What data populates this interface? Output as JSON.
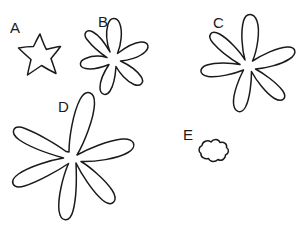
{
  "figure": {
    "width": 303,
    "height": 238,
    "background_color": "#ffffff",
    "stroke_color": "#1a1a1a",
    "label_color": "#1a1a1a"
  },
  "shapes": [
    {
      "id": "A",
      "label": "A",
      "label_x": 10,
      "label_y": 33,
      "petal_count": 5,
      "size": "small",
      "center_x": 40,
      "center_y": 55,
      "bbox": [
        18,
        33,
        62,
        76
      ]
    },
    {
      "id": "B",
      "label": "B",
      "label_x": 98,
      "label_y": 27,
      "petal_count": 6,
      "size": "medium",
      "center_x": 113,
      "center_y": 55,
      "bbox": [
        78,
        18,
        149,
        93
      ]
    },
    {
      "id": "C",
      "label": "C",
      "label_x": 213,
      "label_y": 28,
      "petal_count": 5,
      "size": "large",
      "center_x": 247,
      "center_y": 62,
      "bbox": [
        197,
        12,
        296,
        111
      ]
    },
    {
      "id": "D",
      "label": "D",
      "label_x": 58,
      "label_y": 112,
      "petal_count": 6,
      "size": "largest",
      "center_x": 72,
      "center_y": 158,
      "bbox": [
        10,
        90,
        146,
        223
      ]
    },
    {
      "id": "E",
      "label": "E",
      "label_x": 183,
      "label_y": 140,
      "petal_count": 5,
      "size": "smallest",
      "center_x": 213,
      "center_y": 151,
      "bbox": [
        199,
        139,
        228,
        163
      ]
    }
  ]
}
